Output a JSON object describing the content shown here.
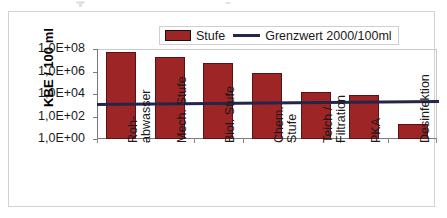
{
  "chart_data": {
    "type": "bar",
    "title": "",
    "xlabel": "",
    "ylabel": "KBE / 100 ml",
    "yscale": "log",
    "ylim": [
      1,
      100000000
    ],
    "ytick_labels": [
      "1,0E+08",
      "1,0E+06",
      "1,0E+04",
      "1,0E+02",
      "1,0E+00"
    ],
    "ytick_values": [
      100000000,
      1000000,
      10000,
      100,
      1
    ],
    "grid": false,
    "legend_position": "top-center",
    "categories": [
      "Roh-abwasser",
      "Mech. Stufe",
      "Biol. Stufe",
      "Chem. Stufe",
      "Teich / Filtration",
      "PKA",
      "Desinfektion"
    ],
    "category_lines": [
      [
        "Roh-",
        "abwasser"
      ],
      [
        "Mech. Stufe"
      ],
      [
        "Biol. Stufe"
      ],
      [
        "Chem.",
        "Stufe"
      ],
      [
        "Teich /",
        "Filtration"
      ],
      [
        "PKA"
      ],
      [
        "Desinfektion"
      ]
    ],
    "series": [
      {
        "name": "Stufe",
        "type": "bar",
        "color": "#9E2526",
        "values": [
          50000000,
          20000000,
          6000000,
          700000,
          15000,
          8000,
          20
        ]
      },
      {
        "name": "Grenzwert 2000/100ml",
        "type": "line",
        "color": "#232649",
        "value": 2000
      }
    ]
  },
  "legend": {
    "bar_label": "Stufe",
    "line_label": "Grenzwert 2000/100ml"
  },
  "axis": {
    "y_title": "KBE / 100 ml"
  }
}
